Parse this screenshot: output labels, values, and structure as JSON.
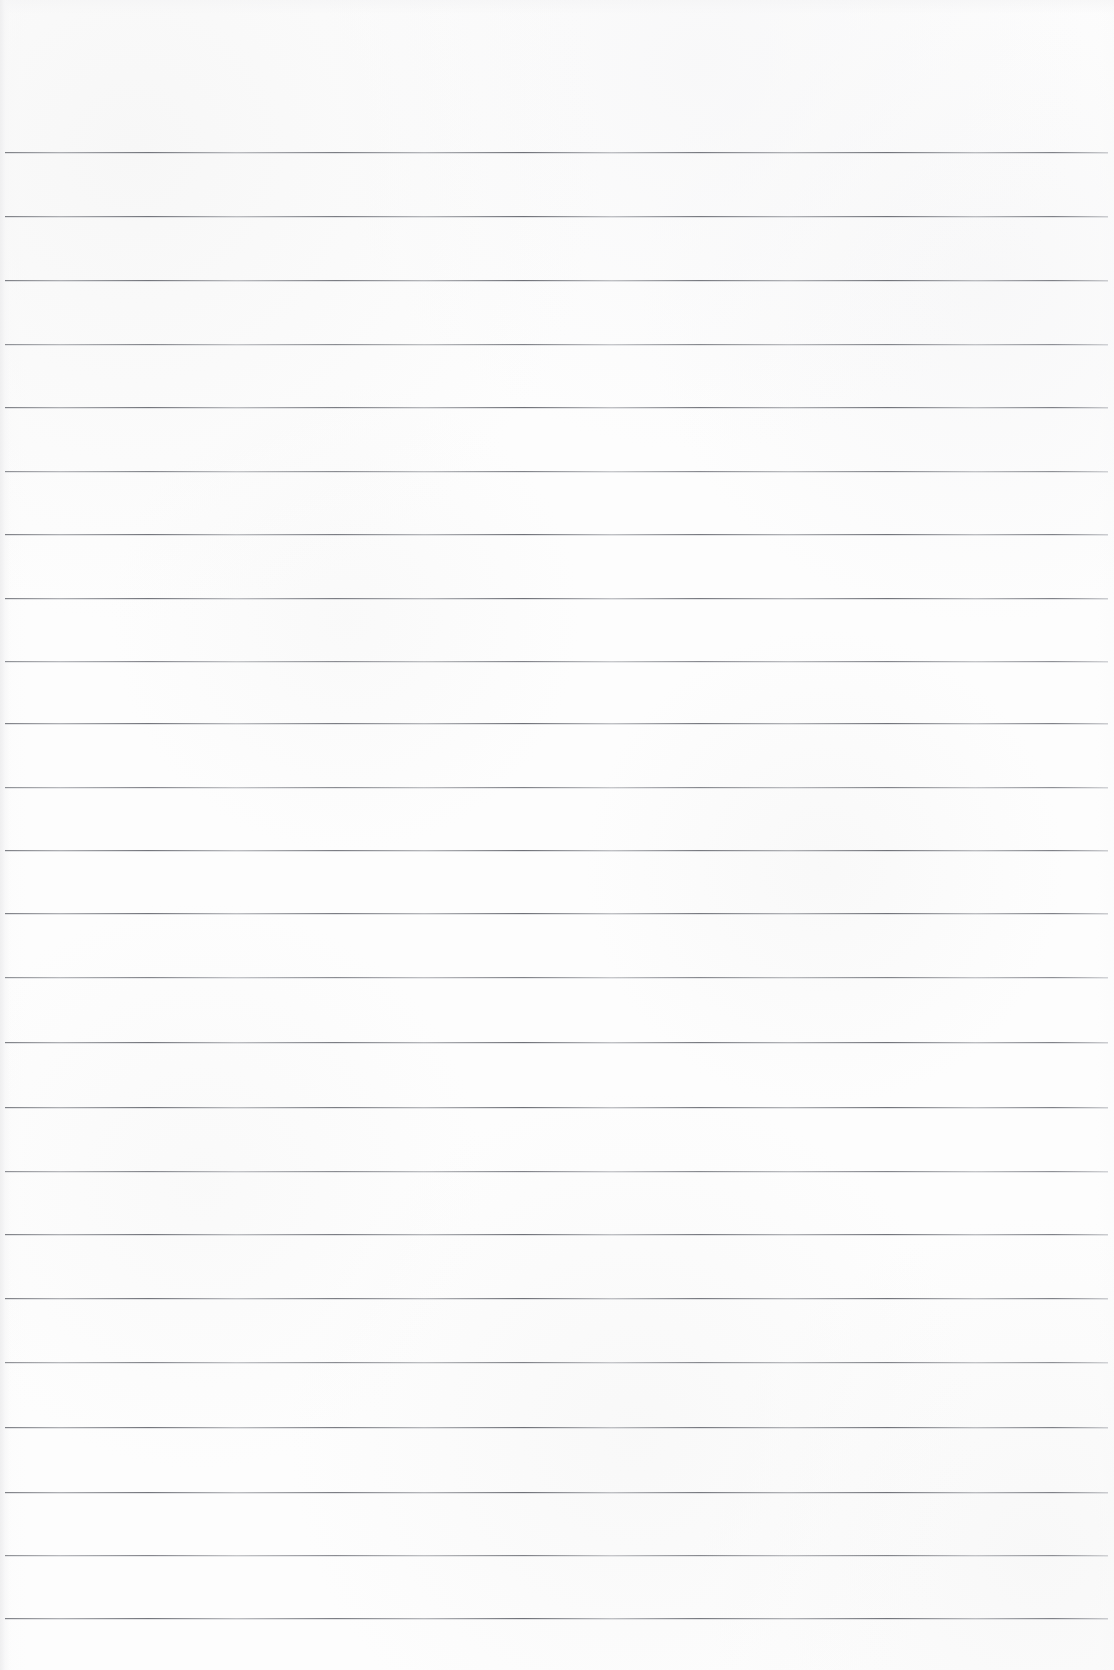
{
  "page": {
    "kind": "ruled-notepad-scan",
    "width_px": 1114,
    "height_px": 1670,
    "background_color": "#fdfdfd",
    "rule_color": "#6e7077",
    "has_text_content": false,
    "written_content": "",
    "top_margin_px": 152,
    "bottom_margin_px": 52,
    "rule_spacing_px": 63.7,
    "rule_thickness_px": 1,
    "rule_start_x_px": 5,
    "rule_end_x_px": 1108,
    "rule_count": 24
  },
  "rules": [
    {
      "index": 1,
      "y": 152,
      "weight": "dark"
    },
    {
      "index": 2,
      "y": 216,
      "weight": "dark"
    },
    {
      "index": 3,
      "y": 280,
      "weight": "dark"
    },
    {
      "index": 4,
      "y": 344,
      "weight": "light"
    },
    {
      "index": 5,
      "y": 407,
      "weight": "dark"
    },
    {
      "index": 6,
      "y": 471,
      "weight": "light"
    },
    {
      "index": 7,
      "y": 534,
      "weight": "dark"
    },
    {
      "index": 8,
      "y": 598,
      "weight": "dark"
    },
    {
      "index": 9,
      "y": 661,
      "weight": "light"
    },
    {
      "index": 10,
      "y": 723,
      "weight": "dark"
    },
    {
      "index": 11,
      "y": 787,
      "weight": "light"
    },
    {
      "index": 12,
      "y": 850,
      "weight": "dark"
    },
    {
      "index": 13,
      "y": 913,
      "weight": "dark"
    },
    {
      "index": 14,
      "y": 977,
      "weight": "light"
    },
    {
      "index": 15,
      "y": 1042,
      "weight": "dark"
    },
    {
      "index": 16,
      "y": 1107,
      "weight": "dark"
    },
    {
      "index": 17,
      "y": 1171,
      "weight": "light"
    },
    {
      "index": 18,
      "y": 1234,
      "weight": "dark"
    },
    {
      "index": 19,
      "y": 1298,
      "weight": "dark"
    },
    {
      "index": 20,
      "y": 1362,
      "weight": "light"
    },
    {
      "index": 21,
      "y": 1427,
      "weight": "dark"
    },
    {
      "index": 22,
      "y": 1492,
      "weight": "dark"
    },
    {
      "index": 23,
      "y": 1555,
      "weight": "light"
    },
    {
      "index": 24,
      "y": 1618,
      "weight": "dark"
    }
  ]
}
